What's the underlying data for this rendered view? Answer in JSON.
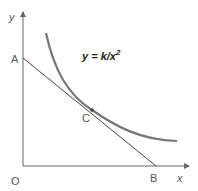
{
  "diagram": {
    "axes": {
      "x_label": "x",
      "y_label": "y",
      "origin_label": "O"
    },
    "points": {
      "A": "A",
      "B": "B",
      "C": "C"
    },
    "curve_equation": {
      "lhs": "y = k/x",
      "exponent": "2"
    },
    "colors": {
      "axis": "#666666",
      "tangent_line": "#444444",
      "curve": "#777777",
      "label": "#555555"
    }
  }
}
